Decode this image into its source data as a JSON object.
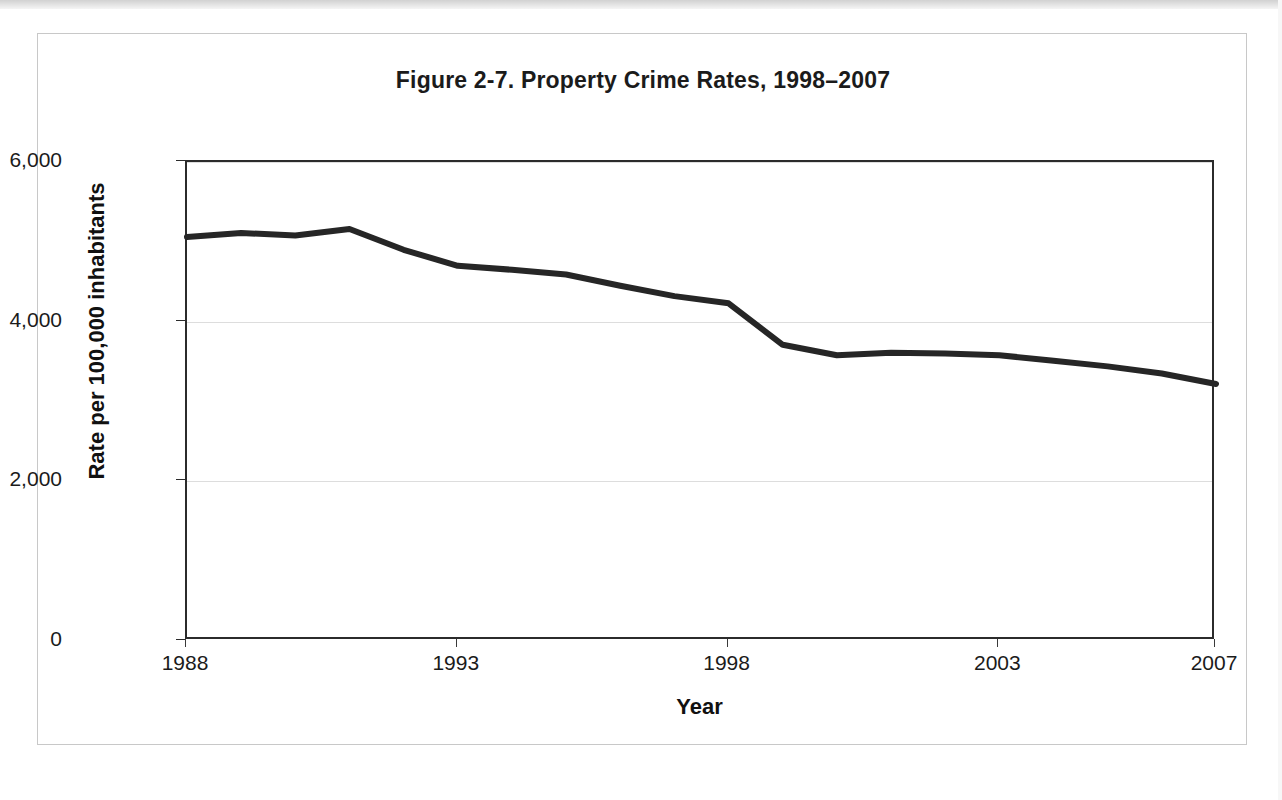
{
  "figure": {
    "title": "Figure 2-7. Property Crime Rates, 1998–2007",
    "x_axis_title": "Year",
    "y_axis_title": "Rate per 100,000 inhabitants"
  },
  "chart_data": {
    "type": "line",
    "title": "Figure 2-7. Property Crime Rates, 1998–2007",
    "xlabel": "Year",
    "ylabel": "Rate per 100,000 inhabitants",
    "xlim": [
      1988,
      2007
    ],
    "ylim": [
      0,
      6000
    ],
    "grid": true,
    "legend": "none",
    "line_color": "#262626",
    "line_width": 6,
    "x_tick_labels": [
      "1988",
      "1993",
      "1998",
      "2003",
      "2007"
    ],
    "x_tick_values": [
      1988,
      1993,
      1998,
      2003,
      2007
    ],
    "y_tick_labels": [
      "0",
      "2,000",
      "4,000",
      "6,000"
    ],
    "y_tick_values": [
      0,
      2000,
      4000,
      6000
    ],
    "x": [
      1988,
      1989,
      1990,
      1991,
      1992,
      1993,
      1994,
      1995,
      1996,
      1997,
      1998,
      1999,
      2000,
      2001,
      2002,
      2003,
      2004,
      2005,
      2006,
      2007
    ],
    "series": [
      {
        "name": "Property crime rate",
        "values": [
          5060,
          5110,
          5080,
          5160,
          4900,
          4700,
          4650,
          4590,
          4450,
          4320,
          4230,
          3710,
          3580,
          3610,
          3600,
          3580,
          3510,
          3440,
          3350,
          3220
        ]
      }
    ]
  }
}
